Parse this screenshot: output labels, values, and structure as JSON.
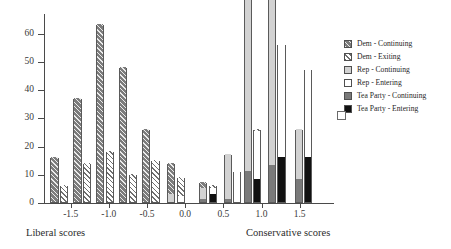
{
  "chart_data": {
    "type": "bar",
    "title": "",
    "xlabel_left": "Liberal scores",
    "xlabel_right": "Conservative scores",
    "ylabel": "",
    "xlim": [
      -1.85,
      1.95
    ],
    "ylim": [
      0,
      67
    ],
    "grid": false,
    "legend_position": "right",
    "xticks": [
      "-1.5",
      "-1.0",
      "-0.5",
      "0.0",
      "0.5",
      "1.0",
      "1.5"
    ],
    "xtick_values": [
      -1.5,
      -1.0,
      -0.5,
      0.0,
      0.5,
      1.0,
      1.5
    ],
    "yticks": [
      "0",
      "10",
      "20",
      "30",
      "40",
      "50",
      "60"
    ],
    "ytick_values": [
      0,
      10,
      20,
      30,
      40,
      50,
      60
    ],
    "series": [
      {
        "name": "Dem - Continuing",
        "key": "dem_continuing",
        "color": "#7c7c7c",
        "pattern": "diagonal-hatch-dark"
      },
      {
        "name": "Dem - Exiting",
        "key": "dem_exiting",
        "color": "#ffffff",
        "pattern": "diagonal-hatch-light"
      },
      {
        "name": "Rep - Continuing",
        "key": "rep_continuing",
        "color": "#d2d2d2",
        "pattern": "solid"
      },
      {
        "name": "Rep - Entering",
        "key": "rep_entering",
        "color": "#ffffff",
        "pattern": "solid"
      },
      {
        "name": "Tea Party - Continuing",
        "key": "tea_continuing",
        "color": "#7a7a7a",
        "pattern": "solid"
      },
      {
        "name": "Tea Party - Entering",
        "key": "tea_entering",
        "color": "#111111",
        "pattern": "solid"
      }
    ],
    "bins": [
      {
        "x": -1.65,
        "dem_continuing": 16,
        "dem_exiting": 6,
        "rep_continuing": 0,
        "rep_entering": 0,
        "tea_continuing": 0,
        "tea_entering": 0
      },
      {
        "x": -1.35,
        "dem_continuing": 37,
        "dem_exiting": 14,
        "rep_continuing": 0,
        "rep_entering": 0,
        "tea_continuing": 0,
        "tea_entering": 0
      },
      {
        "x": -1.05,
        "dem_continuing": 63,
        "dem_exiting": 18,
        "rep_continuing": 0,
        "rep_entering": 0,
        "tea_continuing": 0,
        "tea_entering": 0
      },
      {
        "x": -0.75,
        "dem_continuing": 48,
        "dem_exiting": 10,
        "rep_continuing": 0,
        "rep_entering": 0,
        "tea_continuing": 0,
        "tea_entering": 0
      },
      {
        "x": -0.45,
        "dem_continuing": 26,
        "dem_exiting": 15,
        "rep_continuing": 0,
        "rep_entering": 0,
        "tea_continuing": 0,
        "tea_entering": 0
      },
      {
        "x": -0.12,
        "dem_continuing": 11,
        "dem_exiting": 7,
        "rep_continuing": 3,
        "rep_entering": 2,
        "tea_continuing": 0,
        "tea_entering": 0
      },
      {
        "x": 0.3,
        "dem_continuing": 2,
        "dem_exiting": 1,
        "rep_continuing": 4,
        "rep_entering": 2,
        "tea_continuing": 1,
        "tea_entering": 3
      },
      {
        "x": 0.62,
        "dem_continuing": 0,
        "dem_exiting": 0,
        "rep_continuing": 16,
        "rep_entering": 11,
        "tea_continuing": 1,
        "tea_entering": 0
      },
      {
        "x": 0.88,
        "dem_continuing": 0,
        "dem_exiting": 1,
        "rep_continuing": 62,
        "rep_entering": 17,
        "tea_continuing": 11,
        "tea_entering": 8
      },
      {
        "x": 1.2,
        "dem_continuing": 0,
        "dem_exiting": 0,
        "rep_continuing": 63,
        "rep_entering": 40,
        "tea_continuing": 13,
        "tea_entering": 16
      },
      {
        "x": 1.55,
        "dem_continuing": 0,
        "dem_exiting": 0,
        "rep_continuing": 18,
        "rep_entering": 31,
        "tea_continuing": 8,
        "tea_entering": 16
      }
    ]
  },
  "legend": {
    "items": [
      {
        "label": "Dem - Continuing"
      },
      {
        "label": "Dem - Exiting"
      },
      {
        "label": "Rep - Continuing"
      },
      {
        "label": "Rep - Entering"
      },
      {
        "label": "Tea Party - Continuing"
      },
      {
        "label": "Tea Party - Entering"
      }
    ]
  }
}
